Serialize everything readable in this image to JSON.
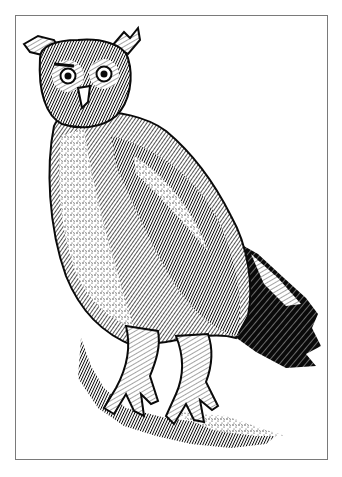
{
  "image": {
    "subject": "owl engraving",
    "style": "black-and-white engraved illustration",
    "colors": {
      "ink": "#0a0a0a",
      "paper": "#ffffff",
      "frame": "#7a7a7a",
      "caption": "#bdbdbd"
    },
    "frame": {
      "x": 15,
      "y": 15,
      "width": 313,
      "height": 445
    }
  },
  "caption": {
    "text": ""
  }
}
